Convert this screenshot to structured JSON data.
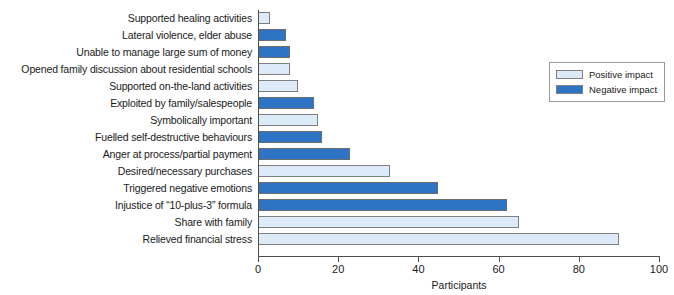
{
  "chart_data": {
    "type": "bar",
    "orientation": "horizontal",
    "title": "",
    "xlabel": "Participants",
    "ylabel": "",
    "xlim": [
      0,
      100
    ],
    "xticks": [
      0,
      20,
      40,
      60,
      80,
      100
    ],
    "grid": false,
    "legend_position": "right",
    "legend": [
      {
        "label": "Positive impact",
        "color": "#dcebf7"
      },
      {
        "label": "Negative impact",
        "color": "#2e74c4"
      }
    ],
    "categories": [
      "Supported healing activities",
      "Lateral violence, elder abuse",
      "Unable to manage large sum of money",
      "Opened family discussion about residential schools",
      "Supported on-the-land activities",
      "Exploited by family/salespeople",
      "Symbolically important",
      "Fuelled self-destructive behaviours",
      "Anger at process/partial payment",
      "Desired/necessary purchases",
      "Triggered negative emotions",
      "Injustice of “10-plus-3” formula",
      "Share with family",
      "Relieved financial stress"
    ],
    "values": [
      3,
      7,
      8,
      8,
      10,
      14,
      15,
      16,
      23,
      33,
      45,
      62,
      65,
      90
    ],
    "impact": [
      "positive",
      "negative",
      "negative",
      "positive",
      "positive",
      "negative",
      "positive",
      "negative",
      "negative",
      "positive",
      "negative",
      "negative",
      "positive",
      "positive"
    ]
  }
}
